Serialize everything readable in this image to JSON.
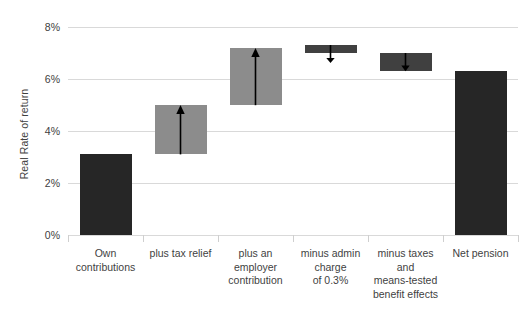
{
  "chart_data": {
    "type": "bar",
    "chart_style": "waterfall",
    "title": "",
    "xlabel": "",
    "ylabel": "Real Rate of return",
    "ylim": [
      0,
      8
    ],
    "y_tick_labels": [
      "0%",
      "2%",
      "4%",
      "6%",
      "8%"
    ],
    "y_tick_values": [
      0,
      2,
      4,
      6,
      8
    ],
    "grid": true,
    "legend": "none",
    "categories": [
      "Own contributions",
      "plus tax relief",
      "plus an employer contribution",
      "minus admin charge of 0.3%",
      "minus taxes and means-tested benefit effects",
      "Net pension"
    ],
    "bars": [
      {
        "label": "Own contributions",
        "base": 0.0,
        "top": 3.1,
        "value": 3.1,
        "kind": "total",
        "color": "#262626",
        "arrow": "none"
      },
      {
        "label": "plus tax relief",
        "base": 3.1,
        "top": 5.0,
        "value": 1.9,
        "kind": "increase",
        "color": "#8c8c8c",
        "arrow": "up"
      },
      {
        "label": "plus an employer contribution",
        "base": 5.0,
        "top": 7.2,
        "value": 2.2,
        "kind": "increase",
        "color": "#8c8c8c",
        "arrow": "up"
      },
      {
        "label": "minus admin charge of 0.3%",
        "base": 7.0,
        "top": 7.3,
        "value": -0.3,
        "kind": "decrease",
        "color": "#404040",
        "arrow": "down"
      },
      {
        "label": "minus taxes and means-tested benefit effects",
        "base": 6.3,
        "top": 7.0,
        "value": -0.7,
        "kind": "decrease",
        "color": "#404040",
        "arrow": "down"
      },
      {
        "label": "Net pension",
        "base": 0.0,
        "top": 6.3,
        "value": 6.3,
        "kind": "total",
        "color": "#262626",
        "arrow": "none"
      }
    ],
    "category_label_lines": [
      [
        "Own",
        "contributions"
      ],
      [
        "plus tax relief"
      ],
      [
        "plus an",
        "employer",
        "contribution"
      ],
      [
        "minus admin",
        "charge",
        "of 0.3%"
      ],
      [
        "minus taxes",
        "and",
        "means-tested",
        "benefit effects"
      ],
      [
        "Net pension"
      ]
    ],
    "colors": {
      "total_bar": "#262626",
      "increase_bar": "#8c8c8c",
      "decrease_bar": "#404040",
      "gridline": "#d9d9d9",
      "arrow": "#000000",
      "text": "#3f3f3f",
      "background": "#ffffff"
    }
  }
}
